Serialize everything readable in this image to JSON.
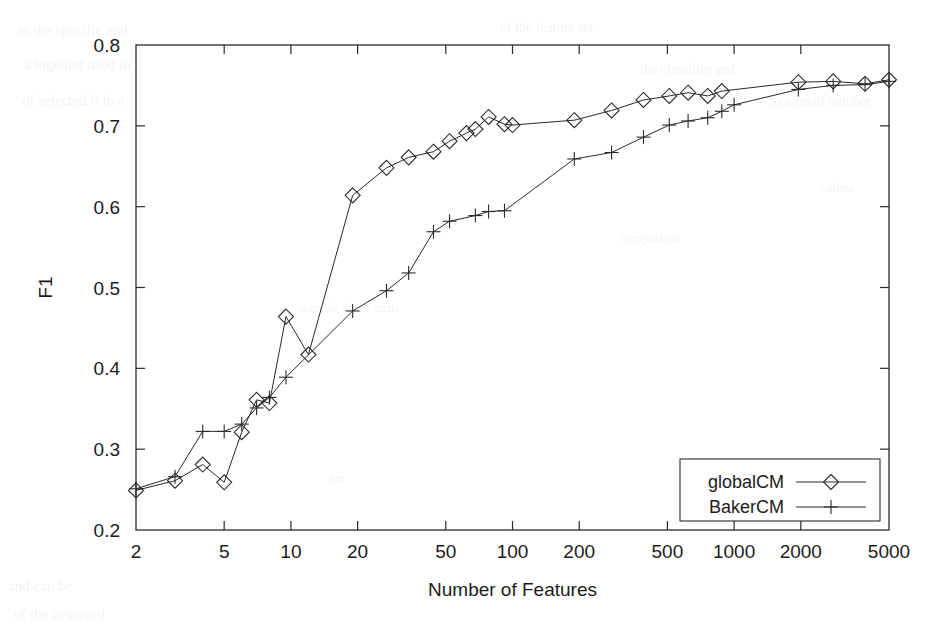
{
  "figure": {
    "background": "#ffffff",
    "ink_color": "#2a2a2a",
    "scan_artifact_color": "#3a3020"
  },
  "chart_data": {
    "type": "line",
    "title": "",
    "xlabel": "Number of Features",
    "ylabel": "F1",
    "xscale": "log",
    "yscale": "linear",
    "xlim": [
      2,
      5000
    ],
    "ylim": [
      0.2,
      0.8
    ],
    "grid": false,
    "legend_position": "bottom-right",
    "xticks": [
      2,
      5,
      10,
      20,
      50,
      100,
      200,
      500,
      1000,
      2000,
      5000
    ],
    "xtick_labels": [
      "2",
      "5",
      "10",
      "20",
      "50",
      "100",
      "200",
      "500",
      "1000",
      "2000",
      "5000"
    ],
    "yticks": [
      0.2,
      0.3,
      0.4,
      0.5,
      0.6,
      0.7,
      0.8
    ],
    "ytick_labels": [
      "0.2",
      "0.3",
      "0.4",
      "0.5",
      "0.6",
      "0.7",
      "0.8"
    ],
    "series": [
      {
        "name": "globalCM",
        "marker": "diamond",
        "linestyle": "solid",
        "points": [
          [
            2,
            0.249
          ],
          [
            3,
            0.261
          ],
          [
            4,
            0.281
          ],
          [
            5,
            0.259
          ],
          [
            6,
            0.321
          ],
          [
            7,
            0.361
          ],
          [
            8,
            0.357
          ],
          [
            9.5,
            0.464
          ],
          [
            12,
            0.417
          ],
          [
            19,
            0.614
          ],
          [
            27,
            0.648
          ],
          [
            34,
            0.661
          ],
          [
            44,
            0.668
          ],
          [
            52,
            0.681
          ],
          [
            62,
            0.691
          ],
          [
            68,
            0.696
          ],
          [
            78,
            0.711
          ],
          [
            92,
            0.702
          ],
          [
            100,
            0.701
          ],
          [
            190,
            0.707
          ],
          [
            280,
            0.719
          ],
          [
            390,
            0.732
          ],
          [
            510,
            0.737
          ],
          [
            620,
            0.741
          ],
          [
            760,
            0.737
          ],
          [
            880,
            0.743
          ],
          [
            1950,
            0.754
          ],
          [
            2800,
            0.755
          ],
          [
            3900,
            0.752
          ],
          [
            5000,
            0.757
          ]
        ]
      },
      {
        "name": "BakerCM",
        "marker": "plus",
        "linestyle": "solid",
        "points": [
          [
            2,
            0.251
          ],
          [
            3,
            0.266
          ],
          [
            4,
            0.322
          ],
          [
            5,
            0.322
          ],
          [
            6,
            0.331
          ],
          [
            7,
            0.351
          ],
          [
            8,
            0.364
          ],
          [
            9.5,
            0.389
          ],
          [
            19,
            0.471
          ],
          [
            27,
            0.496
          ],
          [
            34,
            0.518
          ],
          [
            44,
            0.569
          ],
          [
            52,
            0.582
          ],
          [
            68,
            0.589
          ],
          [
            78,
            0.594
          ],
          [
            92,
            0.595
          ],
          [
            190,
            0.659
          ],
          [
            280,
            0.667
          ],
          [
            390,
            0.686
          ],
          [
            510,
            0.701
          ],
          [
            620,
            0.706
          ],
          [
            760,
            0.71
          ],
          [
            880,
            0.718
          ],
          [
            1000,
            0.726
          ],
          [
            1950,
            0.745
          ],
          [
            2800,
            0.75
          ],
          [
            3900,
            0.751
          ],
          [
            5000,
            0.755
          ]
        ]
      }
    ]
  },
  "legend": {
    "entries": [
      {
        "label": "globalCM",
        "marker": "diamond"
      },
      {
        "label": "BakerCM",
        "marker": "plus"
      }
    ]
  },
  "scan_artifacts": [
    {
      "text": "in  the  specific  and",
      "x": 18,
      "y": 22,
      "size": 15,
      "rot": 0
    },
    {
      "text": "a  together  used  in",
      "x": 24,
      "y": 56,
      "size": 15,
      "rot": 0
    },
    {
      "text": "of  selected  it  in  a",
      "x": 22,
      "y": 92,
      "size": 15,
      "rot": 0
    },
    {
      "text": "of  the  feature  set",
      "x": 500,
      "y": 20,
      "size": 14,
      "rot": 0
    },
    {
      "text": "the  classifier  and",
      "x": 640,
      "y": 62,
      "size": 14,
      "rot": 0
    },
    {
      "text": "to  a  small  number",
      "x": 770,
      "y": 94,
      "size": 14,
      "rot": 0
    },
    {
      "text": "and  can  be",
      "x": 8,
      "y": 578,
      "size": 15,
      "rot": 0
    },
    {
      "text": "of  the  keyword",
      "x": 14,
      "y": 606,
      "size": 15,
      "rot": 0
    },
    {
      "text": "a  result  of  the  term",
      "x": 300,
      "y": 300,
      "size": 13,
      "rot": 0
    },
    {
      "text": "comparison",
      "x": 620,
      "y": 230,
      "size": 13,
      "rot": 0
    },
    {
      "text": "values",
      "x": 820,
      "y": 180,
      "size": 13,
      "rot": 0
    },
    {
      "text": "set",
      "x": 330,
      "y": 470,
      "size": 13,
      "rot": 0
    }
  ]
}
